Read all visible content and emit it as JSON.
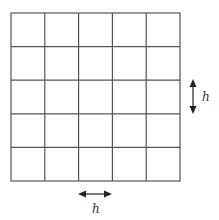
{
  "diagram": {
    "type": "uniform-grid",
    "rows": 5,
    "columns": 5,
    "grid_color": "#555555",
    "spacing_label_horizontal": "h",
    "spacing_label_vertical": "h"
  }
}
